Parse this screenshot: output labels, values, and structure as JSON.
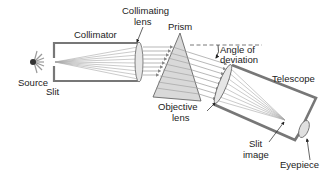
{
  "diagram": {
    "labels": {
      "collimator": "Collimator",
      "collimating_lens_1": "Collimating",
      "collimating_lens_2": "lens",
      "prism": "Prism",
      "angle_1": "Angle of",
      "angle_2": "deviation",
      "telescope": "Telescope",
      "source": "Source",
      "slit": "Slit",
      "objective_1": "Objective",
      "objective_2": "lens",
      "slit_image_1": "Slit",
      "slit_image_2": "image",
      "eyepiece": "Eyepiece"
    },
    "colors": {
      "tube": "#808080",
      "ray": "#9a9a9a",
      "prism_fill": "#d8d8d8",
      "lens_fill": "#e4e4e4",
      "text": "#222222"
    }
  }
}
